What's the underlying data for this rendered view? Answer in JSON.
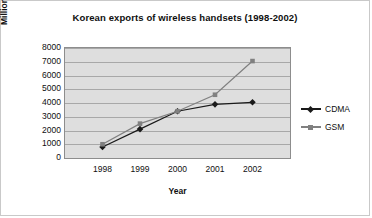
{
  "chart_data": {
    "type": "line",
    "title": "Korean exports of wireless handsets (1998-2002)",
    "xlabel": "Year",
    "ylabel": "Million dollars (US $)",
    "categories": [
      "1998",
      "1999",
      "2000",
      "2001",
      "2002"
    ],
    "ylim": [
      0,
      8000
    ],
    "ytick_step": 1000,
    "yticks": [
      "8000",
      "7000",
      "6000",
      "5000",
      "4000",
      "3000",
      "2000",
      "1000",
      "0"
    ],
    "grid": "horizontal",
    "legend_position": "right",
    "series": [
      {
        "name": "CDMA",
        "color": "#1a1a1a",
        "marker": "diamond",
        "values": [
          800,
          2100,
          3400,
          3900,
          4050
        ]
      },
      {
        "name": "GSM",
        "color": "#808080",
        "marker": "square",
        "values": [
          1000,
          2500,
          3400,
          4600,
          7050
        ]
      }
    ],
    "plot_background": "#dedede",
    "gridline_color": "#a8a8a8",
    "figure_background": "#ffffff"
  }
}
